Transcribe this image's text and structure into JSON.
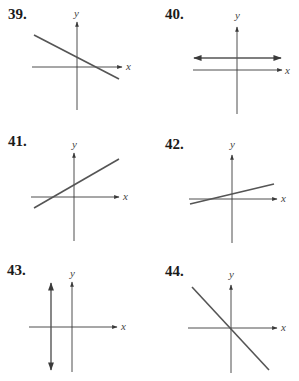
{
  "problems": [
    {
      "number": "39.",
      "x_label": "x",
      "y_label": "y",
      "description": "Line with negative slope, positive y-intercept, crossing x-axis to the right of origin"
    },
    {
      "number": "40.",
      "x_label": "x",
      "y_label": "y",
      "description": "Horizontal line above x-axis (positive y-intercept, zero slope)"
    },
    {
      "number": "41.",
      "x_label": "x",
      "y_label": "y",
      "description": "Line with positive slope, positive y-intercept"
    },
    {
      "number": "42.",
      "x_label": "x",
      "y_label": "y",
      "description": "Line with small positive slope, small positive y-intercept"
    },
    {
      "number": "43.",
      "x_label": "x",
      "y_label": "y",
      "description": "Vertical line left of y-axis (undefined slope, negative x-intercept)"
    },
    {
      "number": "44.",
      "x_label": "x",
      "y_label": "y",
      "description": "Line with negative slope passing through the origin"
    }
  ],
  "colors": {
    "axis": "#3a3a3a",
    "line": "#555555",
    "text": "#1a1a1a"
  }
}
